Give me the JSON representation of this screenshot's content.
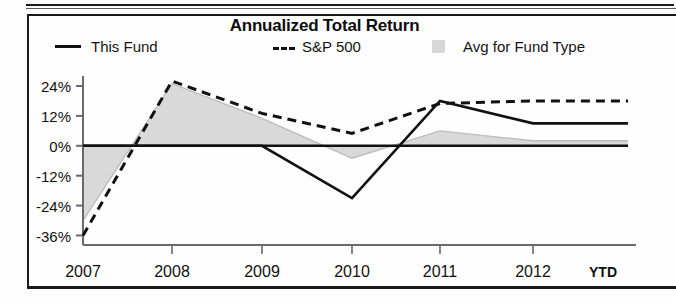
{
  "chart_data": {
    "type": "line",
    "title": "Annualized Total Return",
    "xlabel": "",
    "ylabel": "",
    "categories": [
      "2007",
      "2008",
      "2009",
      "2010",
      "2011",
      "2012 YTD"
    ],
    "ytick_labels": [
      "24%",
      "12%",
      "0%",
      "-12%",
      "-24%",
      "-36%"
    ],
    "ytick_values": [
      24,
      12,
      0,
      -12,
      -24,
      -36
    ],
    "ylim": [
      -40,
      30
    ],
    "grid": false,
    "legend_position": "top",
    "zero_line": true,
    "series": [
      {
        "name": "This Fund",
        "style": "solid-line",
        "color": "#111111",
        "values": [
          0,
          0,
          0,
          -21,
          18,
          9
        ]
      },
      {
        "name": "S&P 500",
        "style": "dashed-line",
        "color": "#111111",
        "values": [
          -36,
          26,
          13,
          5,
          17,
          18
        ]
      },
      {
        "name": "Avg for Fund Type",
        "style": "shaded-area",
        "color": "#d7d7d7",
        "values": [
          -30,
          25,
          11,
          -5,
          6,
          2
        ]
      }
    ]
  },
  "legend": {
    "items": [
      {
        "label": "This Fund",
        "marker": "solid-line-marker"
      },
      {
        "label": "S&P 500",
        "marker": "dashed-line-marker"
      },
      {
        "label": "Avg for Fund Type",
        "marker": "gray-swatch-marker"
      }
    ]
  },
  "axis": {
    "y_labels": [
      "24%",
      "12%",
      "0%",
      "-12%",
      "-24%",
      "-36%"
    ],
    "x_labels": [
      "2007",
      "2008",
      "2009",
      "2010",
      "2011",
      "2012"
    ],
    "x_suffix": "YTD"
  }
}
